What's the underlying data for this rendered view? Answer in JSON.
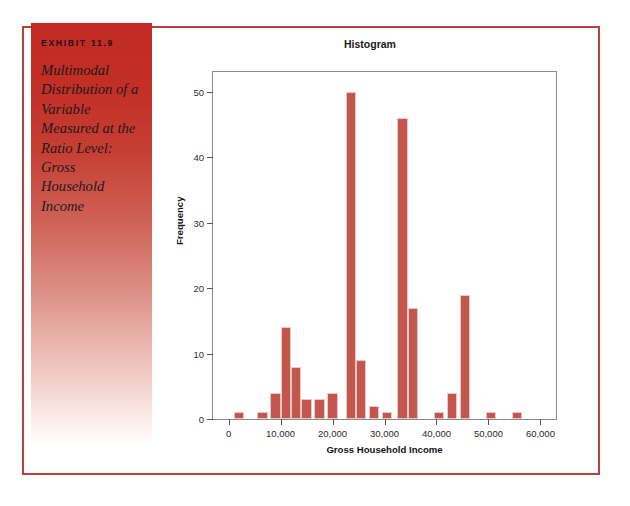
{
  "exhibit": {
    "label": "EXHIBIT 11.9",
    "title": "Multimodal Distribution of a Variable Measured at the Ratio Level: Gross Household Income"
  },
  "colors": {
    "panel_top": "#c22a22",
    "frame_border": "#b8403c",
    "bar_fill": "#c4564e",
    "axis": "#8a8a8a"
  },
  "chart_data": {
    "type": "bar",
    "title": "Histogram",
    "xlabel": "Gross Household Income",
    "ylabel": "Frequency",
    "xlim": [
      -3000,
      63000
    ],
    "ylim": [
      0,
      53
    ],
    "xticks": [
      0,
      10000,
      20000,
      30000,
      40000,
      50000,
      60000
    ],
    "xtick_labels": [
      "0",
      "10,000",
      "20,000",
      "30,000",
      "40,000",
      "50,000",
      "60,000"
    ],
    "yticks": [
      0,
      10,
      20,
      30,
      40,
      50
    ],
    "ytick_labels": [
      "0",
      "10",
      "20",
      "30",
      "40",
      "50"
    ],
    "grid": false,
    "legend": false,
    "bin_width": 2000,
    "bins": [
      {
        "x0": 1000,
        "x1": 3000,
        "value": 1
      },
      {
        "x0": 5500,
        "x1": 7500,
        "value": 1
      },
      {
        "x0": 8000,
        "x1": 10000,
        "value": 4
      },
      {
        "x0": 10000,
        "x1": 12000,
        "value": 14
      },
      {
        "x0": 12000,
        "x1": 14000,
        "value": 8
      },
      {
        "x0": 14000,
        "x1": 16000,
        "value": 3
      },
      {
        "x0": 16500,
        "x1": 18500,
        "value": 3
      },
      {
        "x0": 19000,
        "x1": 21000,
        "value": 4
      },
      {
        "x0": 22500,
        "x1": 24500,
        "value": 50
      },
      {
        "x0": 24500,
        "x1": 26500,
        "value": 9
      },
      {
        "x0": 27000,
        "x1": 29000,
        "value": 2
      },
      {
        "x0": 29500,
        "x1": 31500,
        "value": 1
      },
      {
        "x0": 32500,
        "x1": 34500,
        "value": 46
      },
      {
        "x0": 34500,
        "x1": 36500,
        "value": 17
      },
      {
        "x0": 39500,
        "x1": 41500,
        "value": 1
      },
      {
        "x0": 42000,
        "x1": 44000,
        "value": 4
      },
      {
        "x0": 44500,
        "x1": 46500,
        "value": 19
      },
      {
        "x0": 49500,
        "x1": 51500,
        "value": 1
      },
      {
        "x0": 54500,
        "x1": 56500,
        "value": 1
      }
    ]
  }
}
